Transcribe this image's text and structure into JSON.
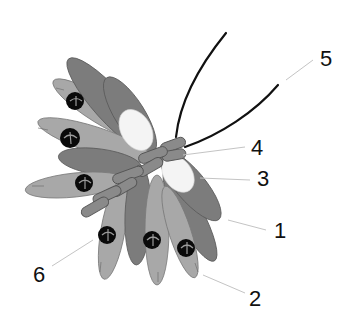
{
  "figure": {
    "type": "schematic illustration",
    "colors": {
      "background": "#ffffff",
      "light_unit": "#a8a8a8",
      "dark_unit": "#7c7c7c",
      "knob": "#0a0a0a",
      "white_oval": "#f4f4f4",
      "rope": "#8a8a8a",
      "filament": "#111111",
      "leader_line": "#c4c4c4"
    }
  },
  "labels": [
    {
      "id": "1",
      "text": "1",
      "x": 280,
      "y": 236
    },
    {
      "id": "2",
      "text": "2",
      "x": 249,
      "y": 306
    },
    {
      "id": "3",
      "text": "3",
      "x": 258,
      "y": 185
    },
    {
      "id": "4",
      "text": "4",
      "x": 252,
      "y": 155
    },
    {
      "id": "5",
      "text": "5",
      "x": 322,
      "y": 66
    },
    {
      "id": "6",
      "text": "6",
      "x": 34,
      "y": 281
    }
  ]
}
